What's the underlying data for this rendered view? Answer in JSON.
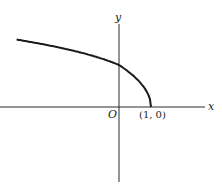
{
  "chart_data": {
    "type": "line",
    "title": "",
    "function": "y = sqrt(1 - x)",
    "xlabel": "x",
    "ylabel": "y",
    "origin_label": "O",
    "annotations": [
      {
        "text": "(1, 0)",
        "x": 1,
        "y": 0
      }
    ],
    "x_range": [
      -3.2,
      2.2
    ],
    "y_range": [
      -2,
      2.1
    ],
    "grid": false,
    "series": [
      {
        "name": "curve",
        "x": [
          -3.2,
          -3,
          -2.5,
          -2,
          -1.5,
          -1,
          -0.5,
          0,
          0.25,
          0.5,
          0.75,
          0.9,
          1
        ],
        "y": [
          2.05,
          2.0,
          1.87,
          1.73,
          1.58,
          1.41,
          1.22,
          1.0,
          0.87,
          0.71,
          0.5,
          0.32,
          0
        ]
      }
    ]
  }
}
